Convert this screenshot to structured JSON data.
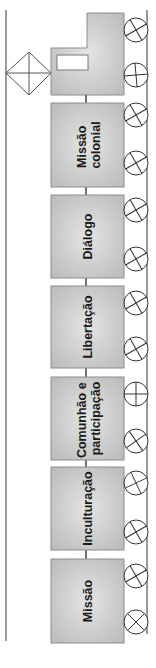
{
  "diagram": {
    "type": "train-timeline",
    "orientation": "vertical (rotated 90° counter-clockwise)",
    "colors": {
      "wagon_fill": "#c8c8c8",
      "wagon_fill_light": "#dcdcdc",
      "wagon_stroke": "#8c8c8c",
      "line": "#555555",
      "text": "#1a1a1a"
    },
    "locomotive": {
      "label": ""
    },
    "wagons": [
      {
        "label_lines": [
          "Missão",
          "colonial"
        ]
      },
      {
        "label_lines": [
          "Diálogo"
        ]
      },
      {
        "label_lines": [
          "Libertação"
        ]
      },
      {
        "label_lines": [
          "Comunhão e",
          "participação"
        ]
      },
      {
        "label_lines": [
          "Inculturação"
        ]
      },
      {
        "label_lines": [
          "Missão"
        ]
      }
    ]
  }
}
